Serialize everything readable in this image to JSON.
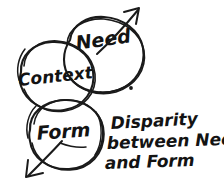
{
  "diagram": {
    "style": "hand-drawn ink sketch",
    "background_color": "#ffffff",
    "ink_color": "#1a1a1a",
    "circles": [
      {
        "id": "need",
        "label": "Need",
        "center_x": 104,
        "center_y": 55,
        "radius_x": 40,
        "radius_y": 37,
        "label_x": 104,
        "label_y": 46,
        "font_size": 19,
        "rotation": -8
      },
      {
        "id": "context",
        "label": "Context",
        "center_x": 57,
        "center_y": 77,
        "radius_x": 38,
        "radius_y": 35,
        "label_x": 56,
        "label_y": 82,
        "font_size": 17,
        "rotation": -6
      },
      {
        "id": "form",
        "label": "Form",
        "center_x": 66,
        "center_y": 135,
        "radius_x": 37,
        "radius_y": 35,
        "label_x": 64,
        "label_y": 138,
        "font_size": 19,
        "rotation": -4
      }
    ],
    "arrows": [
      {
        "id": "need-arrow-up-right",
        "direction": "up-right",
        "from_x": 108,
        "from_y": 48,
        "to_x": 138,
        "to_y": 9
      },
      {
        "id": "form-arrow-down-left",
        "direction": "down-left",
        "from_x": 58,
        "from_y": 144,
        "to_x": 28,
        "to_y": 175
      }
    ],
    "dot_mark": {
      "id": "period-dot",
      "x": 131,
      "y": 88,
      "radius": 1.9
    },
    "annotation": {
      "id": "disparity-note",
      "lines": [
        "Disparity",
        "between Need",
        "and Form"
      ],
      "full_text": "Disparity between Need and Form",
      "x": 110,
      "y_start": 129,
      "line_height": 20,
      "font_size": 17
    }
  }
}
